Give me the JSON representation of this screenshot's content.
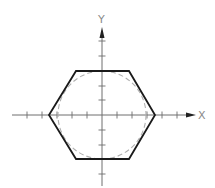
{
  "diagram": {
    "title": "",
    "axes": {
      "x_label": "X",
      "y_label": "Y",
      "origin": [
        102,
        115
      ],
      "tick_spacing_px": 15,
      "x_ticks_px": [
        27,
        42,
        57,
        72,
        87,
        117,
        132,
        147,
        162,
        177
      ],
      "y_ticks_px": [
        41,
        56,
        71,
        86,
        100,
        130,
        145,
        159,
        174
      ],
      "axis_color": "#6e6e6e"
    },
    "shapes": {
      "hexagon": {
        "description": "regular hexagon, flat top and bottom",
        "vertices_px": [
          [
            49,
            115
          ],
          [
            76,
            71
          ],
          [
            129,
            71
          ],
          [
            155,
            115
          ],
          [
            129,
            159
          ],
          [
            76,
            159
          ]
        ],
        "stroke": "#1a1a1a",
        "stroke_width": 1.8
      },
      "inscribed_circle": {
        "description": "dashed circle inscribed in hexagon",
        "center_px": [
          102,
          115
        ],
        "radius_px": 44,
        "stroke": "#b0b0b0",
        "dash": "5,3"
      }
    }
  }
}
